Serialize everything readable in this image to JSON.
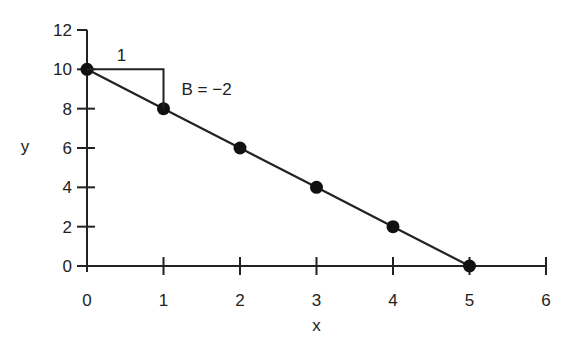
{
  "chart_data": {
    "type": "line",
    "title": "",
    "xlabel": "x",
    "ylabel": "y",
    "xlim": [
      0,
      6
    ],
    "ylim": [
      0,
      12
    ],
    "x_ticks": [
      "0",
      "1",
      "2",
      "3",
      "4",
      "5",
      "6"
    ],
    "y_ticks": [
      "0",
      "2",
      "4",
      "6",
      "8",
      "10",
      "12"
    ],
    "grid": false,
    "series": [
      {
        "name": "y = 10 - 2x",
        "x": [
          0,
          1,
          2,
          3,
          4,
          5
        ],
        "values": [
          10,
          8,
          6,
          4,
          2,
          0
        ],
        "markers": true
      }
    ],
    "annotations": [
      {
        "text": "1",
        "type": "slope-run-label"
      },
      {
        "text": "B = −2",
        "type": "slope-label"
      }
    ]
  }
}
